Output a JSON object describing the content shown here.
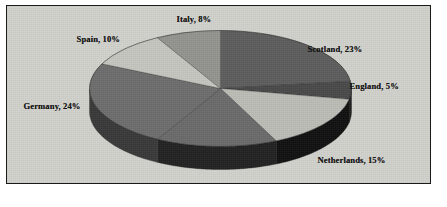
{
  "chart_data": {
    "type": "pie",
    "title": "",
    "subtitle": "",
    "xlabel": "",
    "ylabel": "",
    "legend_position": "none",
    "grid": false,
    "three_d": true,
    "label_format": "{name}, {value}%",
    "categories": [
      "Scotland",
      "England",
      "Netherlands",
      "Switzerland",
      "Germany",
      "Spain",
      "Italy"
    ],
    "values": [
      23,
      5,
      15,
      15,
      24,
      10,
      8
    ],
    "slices": [
      {
        "name": "Scotland",
        "value": 23,
        "label": "Scotland, 23%",
        "color": "#5e5e5e",
        "side_color": "#2b2b2b",
        "start_pct": 0,
        "end_pct": 23,
        "label_x": 302,
        "label_y": 39
      },
      {
        "name": "England",
        "value": 5,
        "label": "England, 5%",
        "color": "#4a4a4a",
        "side_color": "#1f1f1f",
        "start_pct": 23,
        "end_pct": 28,
        "label_x": 344,
        "label_y": 76
      },
      {
        "name": "Netherlands",
        "value": 15,
        "label": "Netherlands, 15%",
        "color": "#bdbdb8",
        "side_color": "#121212",
        "start_pct": 28,
        "end_pct": 43,
        "label_x": 312,
        "label_y": 150
      },
      {
        "name": "Switzerland",
        "value": 15,
        "label": "Switzerland, 15%",
        "color": "#6b6b6b",
        "side_color": "#232323",
        "start_pct": 43,
        "end_pct": 58,
        "label_x": 107,
        "label_y": 186
      },
      {
        "name": "Germany",
        "value": 24,
        "label": "Germany, 24%",
        "color": "#6e6e6e",
        "side_color": "#3a3a3a",
        "start_pct": 58,
        "end_pct": 82,
        "label_x": 18,
        "label_y": 96
      },
      {
        "name": "Spain",
        "value": 10,
        "label": "Spain, 10%",
        "color": "#c6c6c1",
        "side_color": "#6f6f6c",
        "start_pct": 82,
        "end_pct": 92,
        "label_x": 71,
        "label_y": 29
      },
      {
        "name": "Italy",
        "value": 8,
        "label": "Italy, 8%",
        "color": "#949490",
        "side_color": "#4a4a48",
        "start_pct": 92,
        "end_pct": 100,
        "label_x": 171,
        "label_y": 9
      }
    ],
    "geometry": {
      "center_x": 215,
      "center_y": 84,
      "radius_x": 131,
      "radius_y": 58,
      "depth": 23
    },
    "colors": {
      "frame_border": "#1a1a1a",
      "plot_background": "#d2d2cd",
      "page_background": "#ffffff",
      "label_text": "#141414"
    }
  }
}
